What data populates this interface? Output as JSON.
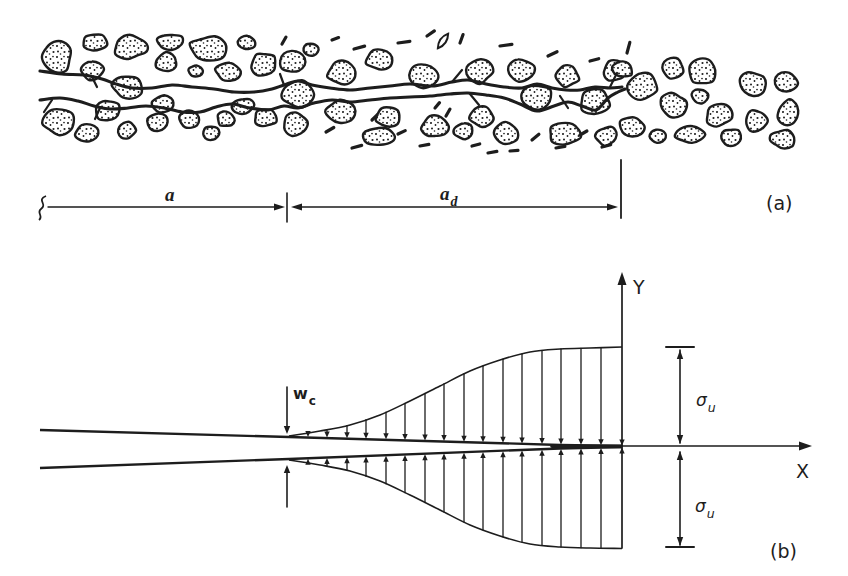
{
  "colors": {
    "ink": "#1d1d1d",
    "paper": "#ffffff"
  },
  "labels": {
    "panel_a": "(a)",
    "panel_b": "(b)",
    "dim_a": "a",
    "dim_ad_base": "a",
    "dim_ad_sub": "d",
    "axis_x": "X",
    "axis_y": "Y",
    "wc_base": "w",
    "wc_sub": "c",
    "sigma_upper_base": "σ",
    "sigma_upper_sub": "u",
    "sigma_lower_base": "σ",
    "sigma_lower_sub": "u"
  },
  "sketch": {
    "stones": [
      [
        57,
        56,
        15,
        16
      ],
      [
        95,
        42,
        13,
        8
      ],
      [
        131,
        47,
        17,
        11
      ],
      [
        170,
        42,
        13,
        8
      ],
      [
        209,
        49,
        19,
        12
      ],
      [
        247,
        43,
        9,
        7
      ],
      [
        293,
        61,
        13,
        11
      ],
      [
        311,
        49,
        7,
        6
      ],
      [
        342,
        72,
        14,
        12
      ],
      [
        380,
        60,
        13,
        10
      ],
      [
        422,
        76,
        15,
        11
      ],
      [
        478,
        71,
        14,
        12
      ],
      [
        521,
        70,
        15,
        11
      ],
      [
        567,
        76,
        12,
        11
      ],
      [
        615,
        71,
        11,
        10
      ],
      [
        92,
        71,
        11,
        10
      ],
      [
        166,
        62,
        10,
        9
      ],
      [
        196,
        71,
        7,
        5
      ],
      [
        228,
        72,
        12,
        9
      ],
      [
        264,
        64,
        13,
        11
      ],
      [
        128,
        87,
        15,
        12
      ],
      [
        299,
        94,
        16,
        13
      ],
      [
        537,
        97,
        16,
        13
      ],
      [
        595,
        101,
        15,
        13
      ],
      [
        58,
        121,
        16,
        13
      ],
      [
        88,
        133,
        12,
        8
      ],
      [
        107,
        110,
        12,
        10
      ],
      [
        127,
        130,
        9,
        8
      ],
      [
        157,
        122,
        10,
        9
      ],
      [
        164,
        104,
        11,
        8
      ],
      [
        190,
        120,
        10,
        9
      ],
      [
        211,
        133,
        9,
        7
      ],
      [
        226,
        119,
        9,
        8
      ],
      [
        243,
        106,
        10,
        8
      ],
      [
        265,
        118,
        11,
        9
      ],
      [
        296,
        124,
        13,
        11
      ],
      [
        342,
        111,
        15,
        12
      ],
      [
        378,
        137,
        17,
        9
      ],
      [
        388,
        117,
        12,
        10
      ],
      [
        435,
        126,
        13,
        11
      ],
      [
        463,
        131,
        10,
        8
      ],
      [
        482,
        117,
        12,
        10
      ],
      [
        506,
        134,
        11,
        11
      ],
      [
        565,
        134,
        16,
        11
      ],
      [
        606,
        136,
        11,
        9
      ],
      [
        632,
        126,
        12,
        10
      ],
      [
        622,
        69,
        10,
        9
      ],
      [
        643,
        86,
        15,
        14
      ],
      [
        672,
        68,
        11,
        10
      ],
      [
        703,
        72,
        14,
        12
      ],
      [
        674,
        105,
        14,
        11
      ],
      [
        700,
        96,
        8,
        7
      ],
      [
        719,
        115,
        13,
        11
      ],
      [
        658,
        136,
        9,
        7
      ],
      [
        690,
        134,
        15,
        9
      ],
      [
        731,
        137,
        10,
        8
      ],
      [
        752,
        84,
        13,
        12
      ],
      [
        786,
        82,
        11,
        9
      ],
      [
        789,
        112,
        11,
        12
      ],
      [
        757,
        121,
        10,
        11
      ],
      [
        783,
        139,
        13,
        9
      ]
    ],
    "dashes": [
      [
        282,
        44,
        8,
        60
      ],
      [
        332,
        40,
        7,
        20
      ],
      [
        354,
        49,
        11,
        15
      ],
      [
        398,
        43,
        12,
        8
      ],
      [
        427,
        36,
        9,
        35
      ],
      [
        460,
        43,
        9,
        70
      ],
      [
        500,
        46,
        12,
        8
      ],
      [
        548,
        56,
        10,
        25
      ],
      [
        590,
        61,
        9,
        15
      ],
      [
        627,
        53,
        11,
        75
      ],
      [
        326,
        132,
        9,
        30
      ],
      [
        352,
        148,
        10,
        15
      ],
      [
        398,
        134,
        8,
        25
      ],
      [
        420,
        146,
        9,
        10
      ],
      [
        446,
        116,
        8,
        60
      ],
      [
        472,
        146,
        8,
        15
      ],
      [
        488,
        153,
        9,
        10
      ],
      [
        510,
        151,
        8,
        5
      ],
      [
        532,
        140,
        9,
        40
      ],
      [
        556,
        148,
        9,
        10
      ],
      [
        580,
        135,
        8,
        30
      ],
      [
        602,
        147,
        9,
        15
      ],
      [
        435,
        108,
        7,
        50
      ],
      [
        372,
        120,
        7,
        45
      ]
    ],
    "lenses": [
      [
        443,
        41,
        18,
        6,
        -55
      ]
    ],
    "crack_upper": [
      [
        40,
        71
      ],
      [
        62,
        74
      ],
      [
        84,
        75
      ],
      [
        102,
        79
      ],
      [
        116,
        84
      ],
      [
        132,
        88
      ],
      [
        152,
        88
      ],
      [
        172,
        85
      ],
      [
        192,
        87
      ],
      [
        214,
        89
      ],
      [
        234,
        92
      ],
      [
        254,
        92
      ],
      [
        272,
        89
      ],
      [
        284,
        85
      ],
      [
        298,
        81
      ],
      [
        312,
        85
      ],
      [
        330,
        88
      ],
      [
        350,
        90
      ],
      [
        370,
        88
      ],
      [
        390,
        86
      ],
      [
        410,
        84
      ],
      [
        432,
        86
      ],
      [
        452,
        82
      ],
      [
        468,
        80
      ],
      [
        486,
        84
      ],
      [
        504,
        87
      ],
      [
        522,
        88
      ],
      [
        537,
        84
      ],
      [
        552,
        88
      ],
      [
        566,
        90
      ],
      [
        580,
        90
      ],
      [
        595,
        87
      ],
      [
        610,
        88
      ],
      [
        622,
        87
      ]
    ],
    "crack_lower": [
      [
        40,
        100
      ],
      [
        60,
        98
      ],
      [
        78,
        101
      ],
      [
        94,
        106
      ],
      [
        110,
        109
      ],
      [
        128,
        108
      ],
      [
        146,
        106
      ],
      [
        164,
        108
      ],
      [
        182,
        112
      ],
      [
        200,
        112
      ],
      [
        216,
        107
      ],
      [
        232,
        104
      ],
      [
        250,
        108
      ],
      [
        268,
        110
      ],
      [
        284,
        106
      ],
      [
        298,
        108
      ],
      [
        314,
        103
      ],
      [
        332,
        100
      ],
      [
        350,
        102
      ],
      [
        370,
        100
      ],
      [
        390,
        98
      ],
      [
        410,
        97
      ],
      [
        430,
        96
      ],
      [
        450,
        94
      ],
      [
        468,
        93
      ],
      [
        486,
        95
      ],
      [
        504,
        98
      ],
      [
        520,
        104
      ],
      [
        537,
        111
      ],
      [
        554,
        106
      ],
      [
        568,
        102
      ],
      [
        582,
        106
      ],
      [
        596,
        110
      ],
      [
        608,
        98
      ],
      [
        618,
        92
      ],
      [
        625,
        89
      ]
    ],
    "branches": [
      [
        [
          92,
          77
        ],
        [
          97,
          87
        ]
      ],
      [
        [
          452,
          82
        ],
        [
          462,
          70
        ]
      ],
      [
        [
          470,
          94
        ],
        [
          479,
          105
        ]
      ],
      [
        [
          560,
          96
        ],
        [
          568,
          108
        ]
      ],
      [
        [
          610,
          87
        ],
        [
          617,
          73
        ]
      ],
      [
        [
          100,
          108
        ],
        [
          95,
          119
        ]
      ],
      [
        [
          52,
          100
        ],
        [
          44,
          112
        ]
      ],
      [
        [
          284,
          85
        ],
        [
          280,
          74
        ]
      ]
    ]
  },
  "dimension": {
    "y": 207,
    "squiggle_x": 42,
    "seg1": [
      48,
      281
    ],
    "seg1_tip": 285,
    "tick_x": 287,
    "tick_y1": 193,
    "tick_y2": 222,
    "seg2": [
      301,
      612
    ],
    "seg2_left_tip": 291,
    "seg2_right_tip": 618,
    "terminator_x": 621,
    "terminator_y1": 160,
    "terminator_y2": 218
  },
  "diagram": {
    "axes": {
      "ox": 622,
      "oy": 446,
      "x_tip": 812,
      "y_tip": 272,
      "y_bottom": 548
    },
    "face_upper": [
      [
        40,
        430
      ],
      [
        289,
        437
      ],
      [
        560,
        445
      ],
      [
        622,
        446
      ]
    ],
    "face_lower": [
      [
        40,
        468
      ],
      [
        289,
        459
      ],
      [
        560,
        448.5
      ],
      [
        622,
        447
      ]
    ],
    "merged_seg": [
      [
        552,
        446.2
      ],
      [
        621,
        446.4
      ]
    ],
    "env_upper": [
      [
        289,
        436
      ],
      [
        320,
        431
      ],
      [
        350,
        425
      ],
      [
        380,
        415
      ],
      [
        410,
        401
      ],
      [
        440,
        386
      ],
      [
        470,
        371
      ],
      [
        500,
        360
      ],
      [
        530,
        352
      ],
      [
        560,
        349
      ],
      [
        590,
        348
      ],
      [
        622,
        347
      ]
    ],
    "env_lower": [
      [
        289,
        460
      ],
      [
        320,
        465
      ],
      [
        350,
        471
      ],
      [
        380,
        481
      ],
      [
        410,
        495
      ],
      [
        440,
        510
      ],
      [
        470,
        525
      ],
      [
        500,
        536
      ],
      [
        530,
        544
      ],
      [
        560,
        547
      ],
      [
        590,
        548
      ],
      [
        622,
        548.5
      ]
    ],
    "arrow_xs": [
      308,
      327,
      347,
      366,
      386,
      405,
      425,
      444,
      464,
      483,
      503,
      522,
      542,
      561,
      581,
      601
    ],
    "wc": {
      "x": 287,
      "top_line": [
        387,
        430
      ],
      "top_tip": 434,
      "bot_line": [
        507,
        469
      ],
      "bot_tip": 465
    },
    "sigma": {
      "x": 680,
      "tick_half": 14,
      "upper": {
        "tick_y": 347,
        "line": [
          350,
          443
        ],
        "tip_up": 350,
        "tip_down": 444
      },
      "lower": {
        "tick_y": 547,
        "line": [
          452,
          545
        ],
        "tip_up": 451,
        "tip_down": 546
      }
    }
  }
}
